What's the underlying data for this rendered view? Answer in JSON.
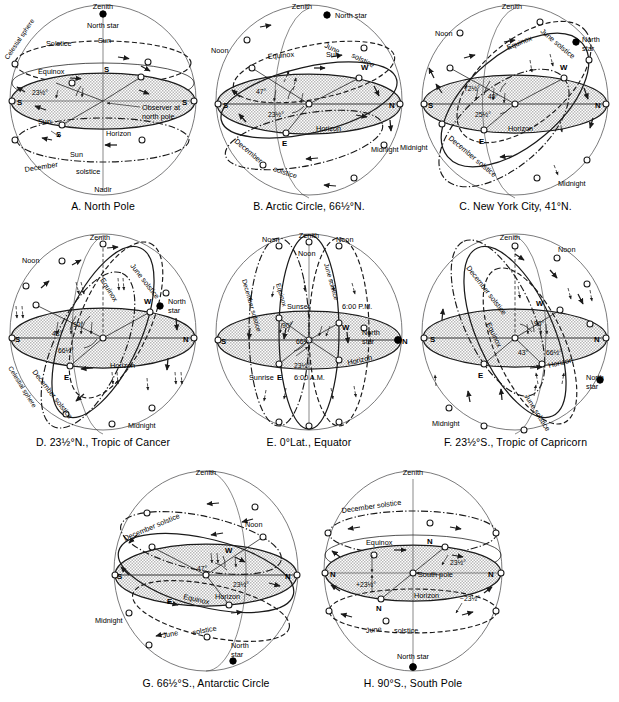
{
  "figure": {
    "panel_count": 8,
    "common_labels": {
      "zenith": "Zenith",
      "nadir": "Nadir",
      "north_star": "North star",
      "horizon": "Horizon",
      "equinox": "Equinox",
      "celestial_sphere": "Celestial sphere",
      "june_solstice": "June solstice",
      "december_solstice": "December solstice",
      "solstice": "Solstice",
      "noon": "Noon",
      "midnight": "Midnight",
      "sun": "Sun",
      "south": "S",
      "north": "N",
      "east": "E",
      "west": "W"
    }
  },
  "panels": [
    {
      "id": "A",
      "caption": "A. North Pole",
      "latitude": "90°N",
      "labels": {
        "zenith": "Zenith",
        "north_star": "North star",
        "celestial_sphere": "Celestial sphere",
        "solstice": "Solstice",
        "sun_top": "Sun",
        "equinox": "Equinox",
        "observer": "Observer at north pole",
        "sun_mid": "Sun",
        "horizon": "Horizon",
        "sun_bottom": "Sun",
        "december": "December",
        "solstice_bottom": "solstice",
        "nadir": "Nadir",
        "s_left": "S",
        "s_right": "S",
        "s_upper": "S",
        "s_lower": "S"
      },
      "angles": [
        "23½°"
      ]
    },
    {
      "id": "B",
      "caption": "B. Arctic Circle, 66½°N.",
      "latitude": "66½°N",
      "labels": {
        "zenith": "Zenith",
        "north_star": "North star",
        "noon": "Noon",
        "june": "June",
        "solstice_june": "solstice",
        "sun": "Sun",
        "equinox": "Equinox",
        "west": "W",
        "south": "S",
        "north": "N",
        "east": "E",
        "horizon": "Horizon",
        "midnight": "Midnight",
        "december": "December",
        "solstice_dec": "solstice"
      },
      "angles": [
        "47°",
        "23½°"
      ]
    },
    {
      "id": "C",
      "caption": "C. New York City, 41°N.",
      "latitude": "41°N",
      "labels": {
        "zenith": "Zenith",
        "noon": "Noon",
        "june_solstice": "June solstice",
        "north_star": "North star",
        "equinox": "Equinox",
        "west": "W",
        "south": "S",
        "north": "N",
        "east": "E",
        "horizon": "Horizon",
        "december_solstice": "December solstice",
        "midnight_left": "Midnight",
        "midnight_right": "Midnight"
      },
      "angles": [
        "72½°",
        "49°",
        "25½°"
      ]
    },
    {
      "id": "D",
      "caption": "D. 23½°N., Tropic of Cancer",
      "latitude": "23½°N",
      "labels": {
        "zenith": "Zenith",
        "noon": "Noon",
        "june_solstice": "June solstice",
        "north_star": "North star",
        "equinox": "Equinox",
        "west": "W",
        "south": "S",
        "north": "N",
        "east": "E",
        "horizon": "Horizon",
        "december_solstice": "December solstice",
        "celestial_sphere": "Celestial sphere",
        "midnight": "Midnight"
      },
      "angles": [
        "90°",
        "43°",
        "66½°"
      ]
    },
    {
      "id": "E",
      "caption": "E. 0°Lat., Equator",
      "latitude": "0°",
      "labels": {
        "zenith": "Zenith",
        "noon_left": "Noon",
        "noon_center": "Noon",
        "noon_right": "Noon",
        "december_solstice": "December solstice",
        "equinox": "Equinox",
        "june_solstice": "June solstice",
        "sunset": "Sunset",
        "pm": "6:00 P.M.",
        "west": "W",
        "north_star": "North star",
        "south": "S",
        "north": "N",
        "east": "E",
        "sunrise": "Sunrise",
        "am": "6:00 A.M.",
        "horizon": "Horizon"
      },
      "angles": [
        "90°",
        "66½°",
        "23½°"
      ]
    },
    {
      "id": "F",
      "caption": "F. 23½°S., Tropic of Capricorn",
      "latitude": "23½°S",
      "labels": {
        "zenith": "Zenith",
        "noon": "Noon",
        "december_solstice": "December solstice",
        "equinox": "Equinox",
        "west": "W",
        "south": "S",
        "north": "N",
        "east": "E",
        "horizon": "Horizon",
        "north_star": "North star",
        "june_solstice": "June solstice",
        "midnight": "Midnight"
      },
      "angles": [
        "90°",
        "43°",
        "66½°"
      ]
    },
    {
      "id": "G",
      "caption": "G. 66½°S., Antarctic Circle",
      "latitude": "66½°S",
      "labels": {
        "zenith": "Zenith",
        "december_solstice": "December solstice",
        "noon": "Noon",
        "west": "W",
        "south": "S",
        "north": "N",
        "east": "E",
        "equinox": "Equinox",
        "horizon": "Horizon",
        "midnight": "Midnight",
        "june": "June",
        "solstice": "solstice",
        "north_star": "North star"
      },
      "angles": [
        "47°",
        "23½°"
      ]
    },
    {
      "id": "H",
      "caption": "H. 90°S., South Pole",
      "latitude": "90°S",
      "labels": {
        "zenith": "Zenith",
        "december_solstice": "December solstice",
        "equinox": "Equinox",
        "south_pole": "South pole",
        "horizon": "Horizon",
        "june": "June",
        "solstice": "solstice",
        "north_star": "North star",
        "n_left": "N",
        "n_right": "N",
        "n_upper": "N",
        "n_lower": "N"
      },
      "angles": [
        "23½°",
        "+23½°",
        "−23½°"
      ]
    }
  ],
  "colors": {
    "ink": "#1a1a1a",
    "outline": "#59595b",
    "horizon_fill": "#c9c9c9",
    "background": "#ffffff"
  }
}
